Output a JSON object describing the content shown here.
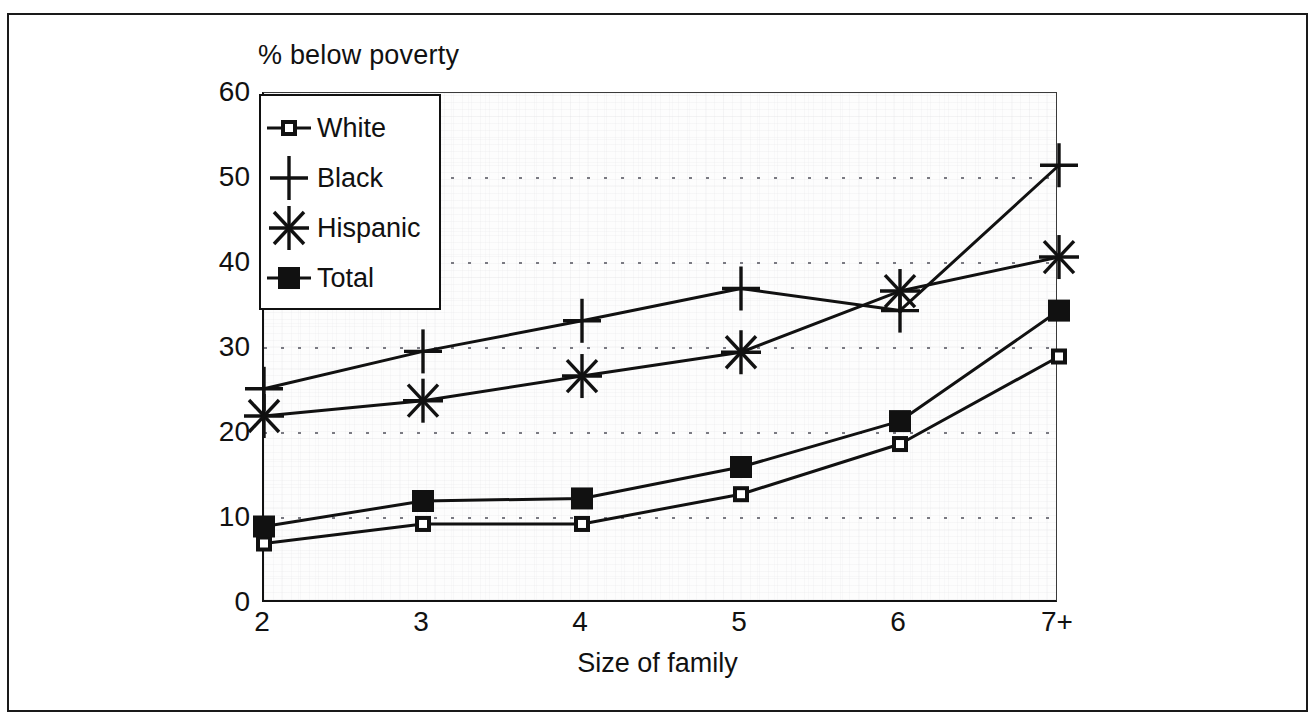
{
  "chart_data": {
    "type": "line",
    "title": "% below poverty",
    "xlabel": "Size of family",
    "ylabel": "",
    "categories": [
      "2",
      "3",
      "4",
      "5",
      "6",
      "7+"
    ],
    "ylim": [
      0,
      60
    ],
    "yticks": [
      0,
      10,
      20,
      30,
      40,
      50,
      60
    ],
    "grid": "horizontal-dotted",
    "legend_position": "top-left-inside",
    "series": [
      {
        "name": "White",
        "marker": "open-square",
        "values": [
          7.0,
          9.3,
          9.3,
          12.8,
          18.7,
          29.0
        ]
      },
      {
        "name": "Black",
        "marker": "plus",
        "values": [
          25.2,
          29.6,
          33.2,
          37.0,
          34.4,
          51.5
        ]
      },
      {
        "name": "Hispanic",
        "marker": "asterisk",
        "values": [
          22.0,
          23.8,
          26.7,
          29.5,
          36.7,
          40.7
        ]
      },
      {
        "name": "Total",
        "marker": "filled-square",
        "values": [
          9.0,
          12.0,
          12.3,
          16.0,
          21.4,
          34.4
        ]
      }
    ]
  },
  "colors": {
    "ink": "#111111",
    "frame": "#1a1a1a",
    "plot_background": "#fdfdfd",
    "gridline": "#7a7a82"
  },
  "legend": {
    "items": [
      {
        "label": "White"
      },
      {
        "label": "Black"
      },
      {
        "label": "Hispanic"
      },
      {
        "label": "Total"
      }
    ]
  }
}
